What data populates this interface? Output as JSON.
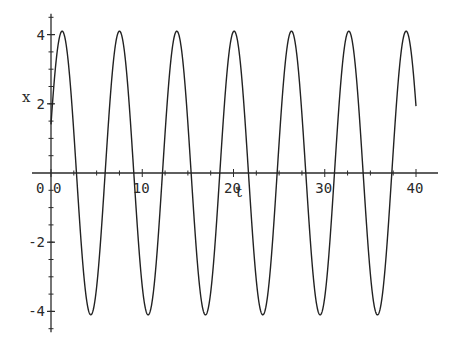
{
  "chart_data": {
    "type": "line",
    "title": "",
    "xlabel": "t",
    "ylabel": "x",
    "xlim": [
      0,
      40
    ],
    "ylim": [
      -4.6,
      4.6
    ],
    "grid": false,
    "legend": null,
    "x_ticks": [
      0,
      10,
      20,
      30,
      40
    ],
    "x_tick_labels": [
      "0",
      "10",
      "20",
      "30",
      "40"
    ],
    "y_ticks": [
      -4,
      -2,
      2,
      4
    ],
    "y_tick_labels": [
      "-4",
      "-2",
      "2",
      "4"
    ],
    "origin_label": "0",
    "series": [
      {
        "name": "x(t)",
        "model": "sinusoid",
        "amplitude": 4.1,
        "angular_frequency": 1.0,
        "phase": 0.35,
        "t_start": 0,
        "t_end": 40,
        "x_at_t0": 1.4,
        "x_at_t_end": 2.3,
        "peaks_t": [
          1.2,
          7.5,
          13.8,
          20.1,
          26.4,
          32.6,
          38.9
        ],
        "troughs_t": [
          4.4,
          10.6,
          16.9,
          23.2,
          29.5,
          35.8
        ],
        "color": "#222222"
      }
    ]
  },
  "colors": {
    "background": "#ffffff",
    "ink": "#222222"
  }
}
